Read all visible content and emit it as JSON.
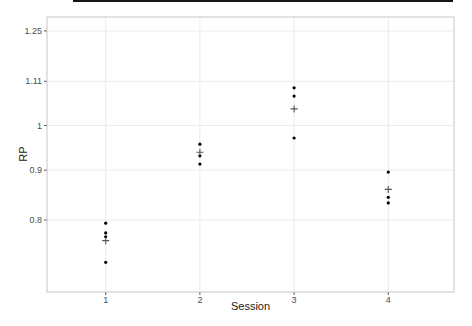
{
  "colors": {
    "point": "#000000",
    "mean_marker": "#555555",
    "grid": "#ececec",
    "panel_border": "#c6c6c6",
    "panel_background": "#ffffff",
    "tick_label": "#4d4d4d",
    "tick_mark": "#555555",
    "axis_title": "#1a1a1a",
    "top_rule": "#151515"
  },
  "chart_data": {
    "type": "scatter",
    "title": "",
    "xlabel": "Session",
    "ylabel": "RP",
    "y_scale": "log",
    "ylim": [
      0.675,
      1.292
    ],
    "grid": "major",
    "x_ticks": [
      {
        "label": "1",
        "value": 1
      },
      {
        "label": "2",
        "value": 2
      },
      {
        "label": "3",
        "value": 3
      },
      {
        "label": "4",
        "value": 4
      }
    ],
    "y_ticks": [
      {
        "label": "1.25",
        "value": 1.25
      },
      {
        "label": "1.11",
        "value": 1.11
      },
      {
        "label": "1",
        "value": 1
      },
      {
        "label": "0.9",
        "value": 0.9
      },
      {
        "label": "0.8",
        "value": 0.8
      }
    ],
    "series": [
      {
        "name": "observations",
        "marker": "dot",
        "points": [
          {
            "x": 1,
            "y": 0.794
          },
          {
            "x": 1,
            "y": 0.776
          },
          {
            "x": 1,
            "y": 0.769
          },
          {
            "x": 1,
            "y": 0.724
          },
          {
            "x": 2,
            "y": 0.957
          },
          {
            "x": 2,
            "y": 0.931
          },
          {
            "x": 2,
            "y": 0.913
          },
          {
            "x": 3,
            "y": 1.093
          },
          {
            "x": 3,
            "y": 1.072
          },
          {
            "x": 3,
            "y": 0.971
          },
          {
            "x": 4,
            "y": 0.896
          },
          {
            "x": 4,
            "y": 0.844
          },
          {
            "x": 4,
            "y": 0.833
          }
        ]
      },
      {
        "name": "session-mean",
        "marker": "plus",
        "points": [
          {
            "x": 1,
            "y": 0.762
          },
          {
            "x": 2,
            "y": 0.939
          },
          {
            "x": 3,
            "y": 1.04
          },
          {
            "x": 4,
            "y": 0.86
          }
        ]
      }
    ]
  }
}
